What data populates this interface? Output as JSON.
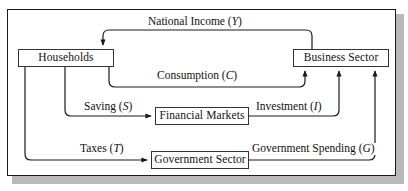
{
  "figure": {
    "type": "circular-flow-diagram",
    "frame": {
      "border_color": "#1a1a1a",
      "background": "#ffffff",
      "shadow_color": "#b9b9b9"
    },
    "line_color": "#1a1a1a"
  },
  "nodes": [
    {
      "id": "households",
      "label": "Households"
    },
    {
      "id": "business-sector",
      "label": "Business  Sector"
    },
    {
      "id": "financial-markets",
      "label": "Financial Markets"
    },
    {
      "id": "government-sector",
      "label": "Government Sector"
    }
  ],
  "flows": [
    {
      "id": "national-income",
      "name": "National Income",
      "symbol": "Y",
      "from": "business-sector",
      "to": "households"
    },
    {
      "id": "consumption",
      "name": "Consumption",
      "symbol": "C",
      "from": "households",
      "to": "business-sector"
    },
    {
      "id": "saving",
      "name": "Saving",
      "symbol": "S",
      "from": "households",
      "to": "financial-markets"
    },
    {
      "id": "investment",
      "name": "Investment",
      "symbol": "I",
      "from": "financial-markets",
      "to": "business-sector"
    },
    {
      "id": "taxes",
      "name": "Taxes",
      "symbol": "T",
      "from": "households",
      "to": "government-sector"
    },
    {
      "id": "government-spending",
      "name": "Government Spending",
      "symbol": "G",
      "from": "government-sector",
      "to": "business-sector"
    }
  ],
  "labels": {
    "national_income": "National Income (",
    "national_income_sym": "Y",
    "national_income_close": ")",
    "consumption": "Consumption (",
    "consumption_sym": "C",
    "consumption_close": ")",
    "saving": "Saving (",
    "saving_sym": "S",
    "saving_close": ")",
    "investment": "Investment (",
    "investment_sym": "I",
    "investment_close": ")",
    "taxes": "Taxes (",
    "taxes_sym": "T",
    "taxes_close": ")",
    "government_spending": "Government Spending (",
    "government_spending_sym": "G",
    "government_spending_close": ")"
  }
}
